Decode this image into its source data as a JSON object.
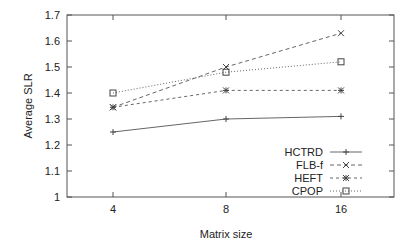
{
  "chart_data": {
    "type": "line",
    "title": "",
    "xlabel": "Matrix size",
    "ylabel": "Average SLR",
    "categories": [
      "4",
      "8",
      "16"
    ],
    "ylim": [
      1,
      1.7
    ],
    "yticks": [
      "1",
      "1.1",
      "1.2",
      "1.3",
      "1.4",
      "1.5",
      "1.6",
      "1.7"
    ],
    "grid": false,
    "legend_position": "lower right",
    "series": [
      {
        "name": "HCTRD",
        "values": [
          1.25,
          1.3,
          1.31
        ],
        "marker": "plus",
        "dash": "solid"
      },
      {
        "name": "FLB-f",
        "values": [
          1.345,
          1.5,
          1.63
        ],
        "marker": "x",
        "dash": "dashed"
      },
      {
        "name": "HEFT",
        "values": [
          1.345,
          1.41,
          1.41
        ],
        "marker": "asterisk",
        "dash": "dashed-short"
      },
      {
        "name": "CPOP",
        "values": [
          1.4,
          1.48,
          1.52
        ],
        "marker": "square",
        "dash": "dotted"
      }
    ]
  }
}
